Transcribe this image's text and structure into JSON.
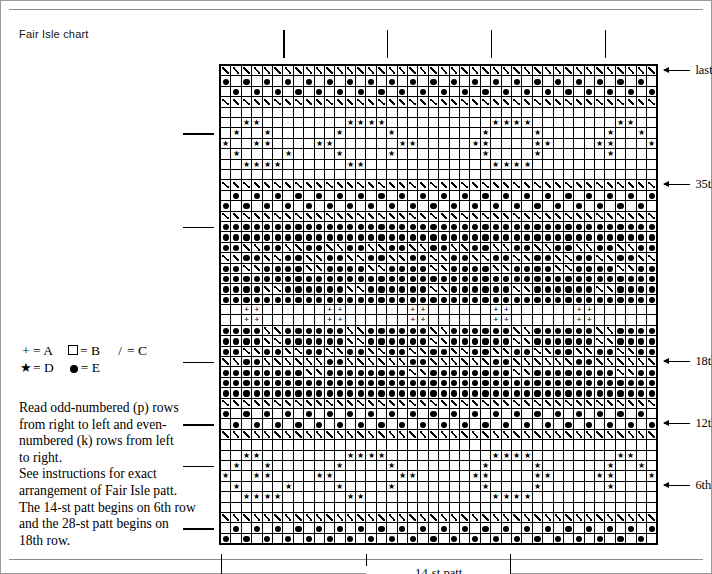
{
  "caption": "Fair Isle chart",
  "legend": {
    "rows": [
      [
        {
          "symbol": "plus",
          "glyph": "+",
          "label": "= A"
        },
        {
          "symbol": "square",
          "glyph": "",
          "label": "= B"
        },
        {
          "symbol": "slash",
          "glyph": "/",
          "label": "= C"
        }
      ],
      [
        {
          "symbol": "star",
          "glyph": "★",
          "label": "= D"
        },
        {
          "symbol": "dot",
          "glyph": "",
          "label": "= E"
        }
      ]
    ]
  },
  "notes": [
    "Read odd-numbered (p) rows",
    "from right to left and even-",
    "numbered (k) rows from left",
    "to right.",
    "See instructions for exact",
    "arrangement of Fair Isle patt.",
    "The 14-st patt begins on 6th row",
    "and the 28-st patt begins on",
    "18th row."
  ],
  "row_labels": [
    {
      "text": "last row",
      "row": 46
    },
    {
      "text": "35th row",
      "row": 35
    },
    {
      "text": "18th row",
      "row": 18
    },
    {
      "text": "12th row",
      "row": 12
    },
    {
      "text": "6th row",
      "row": 6
    }
  ],
  "brackets": [
    {
      "name": "14-st patt",
      "label": "14-st patt",
      "start_col": 15,
      "end_col": 28
    },
    {
      "name": "28-st patt",
      "label": "28-st patt",
      "start_col": 1,
      "end_col": 28
    }
  ],
  "grid": {
    "cols": 42,
    "rows": 46,
    "symbol_key": {
      "A": "+",
      "B": "blank",
      "C": "/",
      "D": "star",
      "E": "dot"
    },
    "left_ticks_rows": [
      40,
      31,
      18,
      12,
      8,
      2
    ],
    "top_ticks_cols": [
      7,
      17,
      27,
      38
    ],
    "rows_data": [
      "CCCCCCCCCCCCCCCCCCCCCCCCCCCCCCCCCCCCCCCCCC",
      "EBEBEBEBEBEBEBEBEBEBEBEBEBEBEBEBEBEBEBEBEB",
      "BEBEBEBEBEBEBEBEBEBEBEBEBEBEBEBEBEBEBEBEBE",
      "CCCCCCCCCCCCCCCCCCCCCCCCCCCCCCCCCCCCCCCCCC",
      "BBBBBBBBBBBBBBBBBBBBBBBBBBBBBBBBBBBBBBBBBB",
      "BBDDBBBBBBBBDDDDBBBBBBBBBBDDDDBBBBBBBBDDBB",
      "BDBBDBBBBBBDBBBBDBBBBBBBBDBBBBDBBBBBBDBBDB",
      "DBBDDBBBBDDBBBBBBDDBBBBBDDBBBBDDBBBBDDBBBD",
      "BDBBBBDBBBBDBBBBDBBBBBBBBDBBBBDBBBBBBDBBBB",
      "BBDDDDBBBBBBDDBBBBBBBBBBBBDDDDBBBBBBBBBBBB",
      "BBBBBBBBBBBBBBBBBBBBBBBBBBBBBBBBBBBBBBBBBB",
      "CCCCCCCCCCCCCCCCCCCCCCCCCCCCCCCCCCCCCCCCCC",
      "BEBEBEBEBEBEBEBEBEBEBEBEBEBEBEBEBEBEBEBEBE",
      "EBEBEBEBEBEBEBEBEBEBEBEBEBEBEBEBEBEBEBEBEB",
      "CCCCCCCCCCCCCCCCCCCCCCCCCCCCCCCCCCCCCCCCCC",
      "EEEEEEEEEEEEEEEEEEEEEEEEEEEEEEEEEEEEEEEEEE",
      "EEEEEEEEEEEEEEEEEEEEEEEEEEEEEEEEEEEEEEEEEE",
      "EECCEECCEECCEECCEECCEECCEECCEECCEECCEECCEE",
      "CCEECCEECCEECCEECCEECCEECCEECCEECCEECCEECC",
      "EECCEEEECCEEEECCEEEECCEEEECCEEEECCEEEECCEE",
      "EEEEEEEEEEEEEEEEEEEEEEEEEEEEEEEEEEEEEEEEEE",
      "EEEECCEEEEEECCEEEEEECCEEEEEECCEEEEEECCEEEE",
      "EEEEEEEEEEEEEEEEEEEEEEEEEEEEEEEEEEEEEEEEEE",
      "BBAABBBBBBAABBBBBBAABBBBBBAABBBBBBAABBBBBB",
      "BBAABBBBBBAABBBBBBAABBBBBBAABBBBBBAABBBBBB",
      "EEEECCEEEEEECCEEEEEECCEEEEEECCEEEEEECCEEEE",
      "EEEECCEEEEEECCEEEEEECCEEEEEECCEEEEEECCEEEE",
      "EECCEECCEECCEECCEECCEECCEECCEECCEECCEECCEE",
      "CCEECCCCCCEECCCCCCEECCCCCCEECCCCCCEECCCCCC",
      "EEEEEEEECCEEEEEEEECCEEEEEEEECCEEEEEEEECCEE",
      "EEEEEEEEEEEEEEEEEEEEEEEEEEEEEEEEEEEEEEEEEE",
      "EEEEEEEEEEEEEEEEEEEEEEEEEEEEEEEEEEEEEEEEEE",
      "CCCCCCCCCCCCCCCCCCCCCCCCCCCCCCCCCCCCCCCCCC",
      "EBEBEBEBEBEBEBEBEBEBEBEBEBEBEBEBEBEBEBEBEB",
      "BEBEBEBEBEBEBEBEBEBEBEBEBEBEBEBEBEBEBEBEBE",
      "CCCCCCCCCCCCCCCCCCCCCCCCCCCCCCCCCCCCCCCCCC",
      "BBBBBBBBBBBBBBBBBBBBBBBBBBBBBBBBBBBBBBBBBB",
      "BBDDBBBBBBBBDDDDBBBBBBBBBBDDDDBBBBBBBBDDBB",
      "BDBBDBBBBBBDBBBBDBBBBBBBBDBBBBDBBBBBBDBBDB",
      "DBBDDBBBBDDBBBBBBDDBBBBBDDBBBBDDBBBBDDBBBD",
      "BDBBBBDBBBBDBBBBDBBBBBBBBDBBBBDBBBBBBDBBBB",
      "BBDDDDBBBBBBDDBBBBBBBBBBBBDDDDBBBBBBBBBBBB",
      "BBBBBBBBBBBBBBBBBBBBBBBBBBBBBBBBBBBBBBBBBB",
      "CCCCCCCCCCCCCCCCCCCCCCCCCCCCCCCCCCCCCCCCCC",
      "BEBEBEBEBEBEBEBEBEBEBEBEBEBEBEBEBEBEBEBEBE",
      "EBEBEBEBEBEBEBEBEBEBEBEBEBEBEBEBEBEBEBEBEB"
    ]
  }
}
